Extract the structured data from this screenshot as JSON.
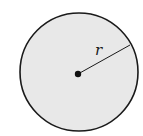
{
  "diagram": {
    "shape": "circle",
    "fill_color": "#e8e8e8",
    "stroke_color": "#1a1a1a",
    "center": {
      "x": 78,
      "y": 73
    },
    "radius_px": 59,
    "center_dot": {
      "x": 78,
      "y": 74,
      "r": 3
    },
    "radius_line": {
      "x1": 78,
      "y1": 74,
      "x2": 129,
      "y2": 45
    },
    "radius_label": "r"
  }
}
